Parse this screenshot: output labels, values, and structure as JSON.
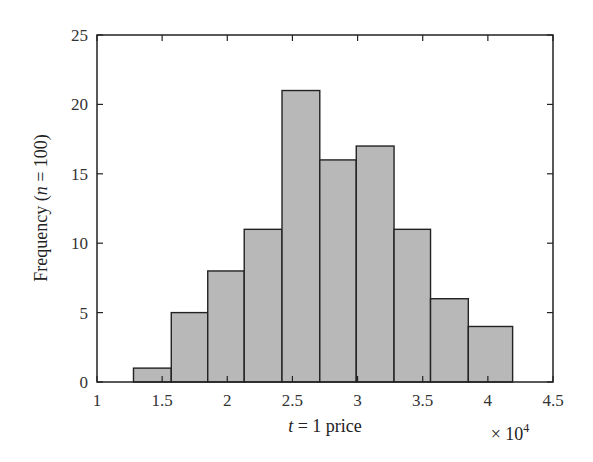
{
  "chart_data": {
    "type": "bar",
    "subtype": "histogram",
    "title": "",
    "xlabel": "t = 1 price",
    "xlabel_parts": {
      "var": "t",
      "rest": " = 1 price"
    },
    "ylabel": "Frequency (n = 100)",
    "ylabel_parts": {
      "pre": "Frequency (",
      "var": "n",
      "post": " = 100)"
    },
    "x_multiplier": "× 10^4",
    "x_multiplier_parts": {
      "base": "× 10",
      "exp": "4"
    },
    "xlim": [
      1,
      4.5
    ],
    "ylim": [
      0,
      25
    ],
    "xticks": [
      "1",
      "1.5",
      "2",
      "2.5",
      "3",
      "3.5",
      "4",
      "4.5"
    ],
    "xtick_values": [
      1,
      1.5,
      2,
      2.5,
      3,
      3.5,
      4,
      4.5
    ],
    "yticks": [
      "0",
      "5",
      "10",
      "15",
      "20",
      "25"
    ],
    "ytick_values": [
      0,
      5,
      10,
      15,
      20,
      25
    ],
    "bin_edges": [
      1.28,
      1.57,
      1.85,
      2.13,
      2.42,
      2.71,
      2.99,
      3.28,
      3.56,
      3.85,
      4.19
    ],
    "values": [
      1,
      5,
      8,
      11,
      21,
      16,
      17,
      11,
      6,
      4
    ],
    "grid": false,
    "legend": null,
    "colors": {
      "bar_fill": "#b8b8b8",
      "bar_edge": "#222222",
      "axis": "#222222"
    }
  }
}
